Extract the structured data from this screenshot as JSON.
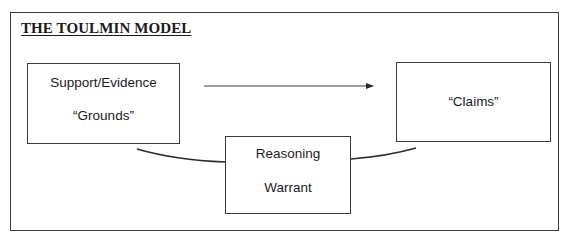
{
  "diagram": {
    "title": "THE TOULMIN MODEL",
    "nodes": {
      "grounds": {
        "line1": "Support/Evidence",
        "line2": "“Grounds”"
      },
      "claims": {
        "line1": "“Claims”"
      },
      "warrant": {
        "line1": "Reasoning",
        "line2": "Warrant"
      }
    },
    "edges": [
      {
        "from": "grounds",
        "to": "claims",
        "type": "arrow"
      },
      {
        "from": "grounds",
        "to": "warrant",
        "type": "curve"
      },
      {
        "from": "warrant",
        "to": "claims",
        "type": "curve"
      }
    ],
    "colors": {
      "stroke": "#3a3a3a",
      "text": "#1a1a1a",
      "background": "#ffffff"
    }
  }
}
